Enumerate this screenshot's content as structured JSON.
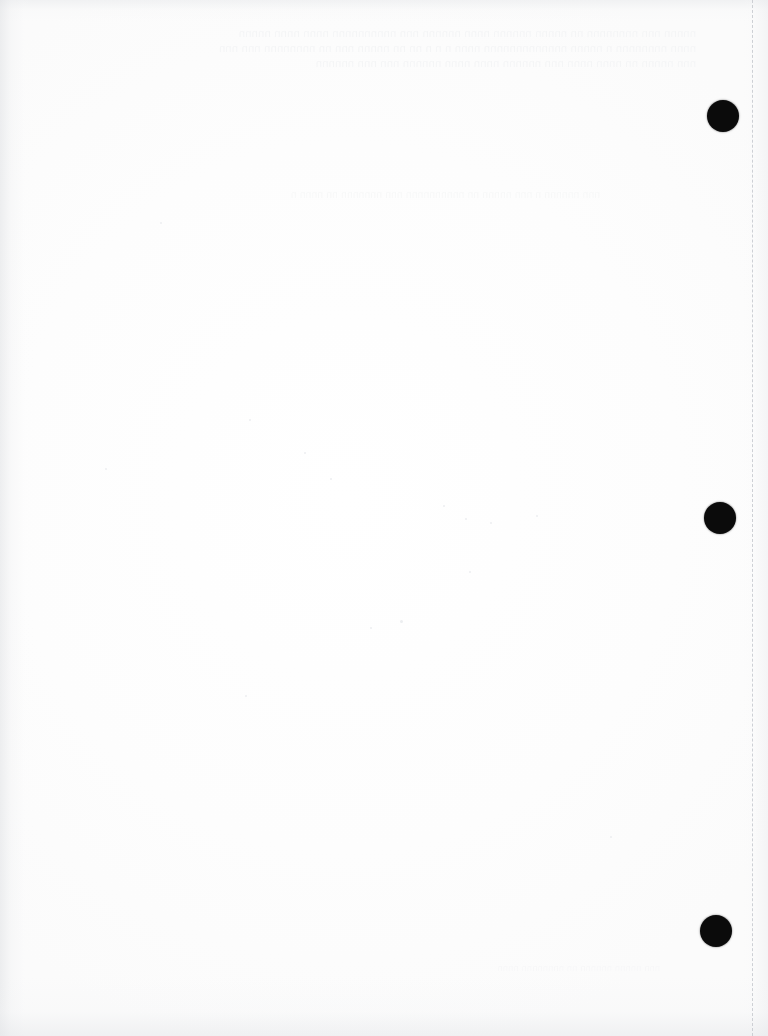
{
  "document": {
    "page_type": "scanned-blank-page",
    "page_width": 768,
    "page_height": 1036,
    "background_color": "#fefefe",
    "paper_tone": "#fdfdfd",
    "visible_body_text": "",
    "description": "Scanned blank sheet of paper with three black hole-punch / binder marks along the right margin and a dashed scan-boundary guide near the right edge."
  },
  "ghost_text": {
    "note": "Illegible bleed-through from the reverse side of the sheet; rendered as faint unreadable ghosting only.",
    "header_band": "nnnnn nnn nnnnnnnn nn nnnnn nnnnnn nnnn nnnnnn nnn nnnnnnnnnn nnnn nnnn nnnnn\nnnnn nnnnnnnn n nnnnn nnnnnnnnnnnnn nnnn n n n nn nn nnnnn nnn nn nnnnnnnn nnn nnn\nnnn nnnnn nn nnnn nnnn nnn nnnnnn nnnn nnnn nnnnnn nnn nnn nnnnnn",
    "mid_band": "nnn nnnnnn n nnn nnnnn nn nnnnnnnnnn nnn nnnnnnn nn nnnn n",
    "lower_band": "nnn nnnnn nnnnnn nn nnnnnnnn nnnn"
  },
  "punch_marks": {
    "color": "#0b0b0b",
    "count": 3,
    "items": [
      {
        "label": "top-punch-mark",
        "cx": 723,
        "cy": 116,
        "d": 32
      },
      {
        "label": "middle-punch-mark",
        "cx": 720,
        "cy": 518,
        "d": 32
      },
      {
        "label": "bottom-punch-mark",
        "cx": 716,
        "cy": 931,
        "d": 32
      }
    ]
  },
  "page_guide": {
    "label": "page-boundary-guide",
    "x": 752,
    "style": "dashed",
    "color": "#c9ccd1"
  },
  "specks": [
    {
      "x": 249,
      "y": 419,
      "s": 2
    },
    {
      "x": 304,
      "y": 452,
      "s": 2
    },
    {
      "x": 105,
      "y": 468,
      "s": 2
    },
    {
      "x": 330,
      "y": 478,
      "s": 2
    },
    {
      "x": 443,
      "y": 505,
      "s": 2
    },
    {
      "x": 465,
      "y": 518,
      "s": 2
    },
    {
      "x": 490,
      "y": 522,
      "s": 2
    },
    {
      "x": 536,
      "y": 515,
      "s": 2
    },
    {
      "x": 469,
      "y": 571,
      "s": 2
    },
    {
      "x": 245,
      "y": 695,
      "s": 2
    },
    {
      "x": 400,
      "y": 620,
      "s": 3
    },
    {
      "x": 370,
      "y": 627,
      "s": 2
    },
    {
      "x": 610,
      "y": 836,
      "s": 2
    },
    {
      "x": 160,
      "y": 222,
      "s": 2
    }
  ]
}
